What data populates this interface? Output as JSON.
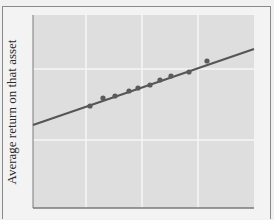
{
  "chart_data": {
    "type": "scatter",
    "title": "",
    "xlabel": "",
    "ylabel": "Average return on that asset",
    "grid": true,
    "legend": null,
    "x_ticks": [],
    "y_ticks": [],
    "x_gridlines_px": [
      86,
      142,
      198
    ],
    "y_gridlines_px": [
      69,
      140
    ],
    "plot_area_px": {
      "left": 33,
      "top": 15,
      "right": 254,
      "bottom": 208
    },
    "points": [
      {
        "x": 90,
        "y": 106
      },
      {
        "x": 103,
        "y": 98
      },
      {
        "x": 115,
        "y": 96
      },
      {
        "x": 129,
        "y": 91
      },
      {
        "x": 138,
        "y": 88
      },
      {
        "x": 150,
        "y": 85
      },
      {
        "x": 160,
        "y": 80
      },
      {
        "x": 171,
        "y": 76
      },
      {
        "x": 189,
        "y": 72
      },
      {
        "x": 207,
        "y": 61
      }
    ],
    "fit_line": {
      "x1": 33,
      "y1": 125,
      "x2": 254,
      "y2": 49
    },
    "colors": {
      "plot_background": "#dedede",
      "gridline": "#f6f6f6",
      "line": "#555555",
      "point": "#5a5a5a",
      "axis": "#7a7a7a"
    }
  }
}
